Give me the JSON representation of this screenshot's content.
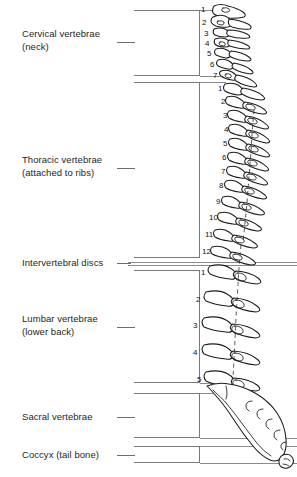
{
  "figure": {
    "view": "lateral",
    "regions": [
      {
        "id": "cervical",
        "label": "Cervical vertebrae\n(neck)",
        "count": 7,
        "numbers": [
          "1",
          "2",
          "3",
          "4",
          "5",
          "6",
          "7"
        ]
      },
      {
        "id": "thoracic",
        "label": "Thoracic vertebrae\n(attached to ribs)",
        "count": 12,
        "numbers": [
          "1",
          "2",
          "3",
          "4",
          "5",
          "6",
          "7",
          "8",
          "9",
          "10",
          "11",
          "12"
        ]
      },
      {
        "id": "discs",
        "label": "Intervertebral discs",
        "count": 0,
        "numbers": []
      },
      {
        "id": "lumbar",
        "label": "Lumbar vertebrae\n(lower back)",
        "count": 5,
        "numbers": [
          "1",
          "2",
          "3",
          "4",
          "5"
        ]
      },
      {
        "id": "sacral",
        "label": "Sacral vertebrae",
        "count": 0,
        "numbers": []
      },
      {
        "id": "coccyx",
        "label": "Coccyx (tail bone)",
        "count": 0,
        "numbers": []
      }
    ],
    "colors": {
      "outline": "#1b1b1b",
      "bracket": "#7a7a7a",
      "text": "#262626",
      "background": "#ffffff"
    }
  }
}
